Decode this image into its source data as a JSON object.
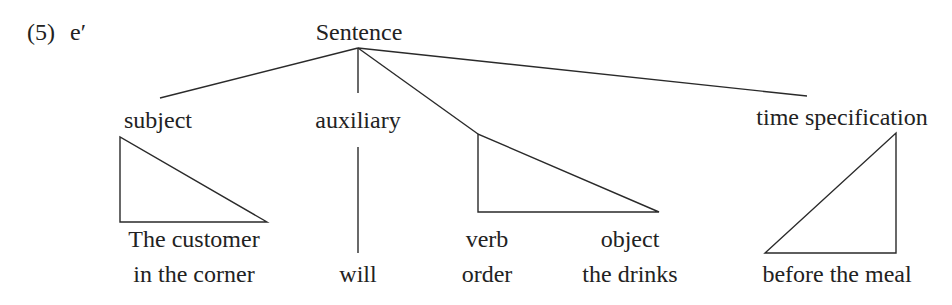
{
  "example": {
    "number": "(5)",
    "label": "e′"
  },
  "tree": {
    "root": "Sentence",
    "constituents": [
      {
        "id": "subject",
        "category": "subject",
        "words": [
          "The customer",
          "in the corner"
        ],
        "node": "triangle"
      },
      {
        "id": "auxiliary",
        "category": "auxiliary",
        "words": [
          "will"
        ],
        "node": "line"
      },
      {
        "id": "predicate",
        "category": "",
        "children": [
          {
            "category": "verb",
            "words": [
              "order"
            ]
          },
          {
            "category": "object",
            "words": [
              "the drinks"
            ]
          }
        ],
        "node": "triangle"
      },
      {
        "id": "time",
        "category": "time specification",
        "words": [
          "before the meal"
        ],
        "node": "triangle"
      }
    ]
  },
  "labels": {
    "example_number": "(5)",
    "example_letter": "e′",
    "root": "Sentence",
    "subject": "subject",
    "auxiliary": "auxiliary",
    "time": "time specification",
    "subject_line1": "The customer",
    "subject_line2": "in the corner",
    "aux_word": "will",
    "verb": "verb",
    "verb_word": "order",
    "object": "object",
    "object_word": "the drinks",
    "time_word": "before the meal"
  },
  "colors": {
    "ink": "#222222",
    "background": "#ffffff"
  }
}
